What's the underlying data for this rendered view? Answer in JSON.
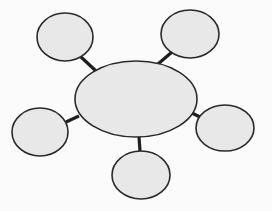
{
  "diagram": {
    "type": "bubble-map",
    "colors": {
      "background": "#fbfbfb",
      "node_fill": "#e8e8e8",
      "node_stroke": "#2a2a2a",
      "connector": "#1e1e1e"
    },
    "center": {
      "cx": 136,
      "cy": 99,
      "rx": 61,
      "ry": 38,
      "label": ""
    },
    "nodes": [
      {
        "id": "top-left",
        "cx": 65,
        "cy": 37,
        "rx": 28,
        "ry": 24,
        "label": ""
      },
      {
        "id": "top-right",
        "cx": 190,
        "cy": 34,
        "rx": 29,
        "ry": 24,
        "label": ""
      },
      {
        "id": "right",
        "cx": 225,
        "cy": 128,
        "rx": 29,
        "ry": 23,
        "label": ""
      },
      {
        "id": "bottom",
        "cx": 141,
        "cy": 175,
        "rx": 29,
        "ry": 24,
        "label": ""
      },
      {
        "id": "left",
        "cx": 40,
        "cy": 132,
        "rx": 28,
        "ry": 24,
        "label": ""
      }
    ],
    "connectors": [
      {
        "from": "center",
        "to": "top-left",
        "x1": 96,
        "y1": 71,
        "x2": 81,
        "y2": 57
      },
      {
        "from": "center",
        "to": "top-right",
        "x1": 158,
        "y1": 64,
        "x2": 172,
        "y2": 52
      },
      {
        "from": "center",
        "to": "right",
        "x1": 190,
        "y1": 112,
        "x2": 200,
        "y2": 117
      },
      {
        "from": "center",
        "to": "bottom",
        "x1": 139,
        "y1": 137,
        "x2": 140,
        "y2": 151
      },
      {
        "from": "center",
        "to": "left",
        "x1": 79,
        "y1": 116,
        "x2": 66,
        "y2": 122
      }
    ]
  }
}
